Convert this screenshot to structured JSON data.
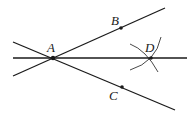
{
  "diagram": {
    "type": "geometry-construction",
    "stroke_color": "#1a1a1a",
    "background": "#ffffff",
    "points": [
      {
        "id": "A",
        "label": "A",
        "x": 53,
        "y": 58,
        "label_x": 47,
        "label_y": 52
      },
      {
        "id": "B",
        "label": "B",
        "x": 121,
        "y": 28,
        "label_x": 111,
        "label_y": 25
      },
      {
        "id": "C",
        "label": "C",
        "x": 122,
        "y": 87,
        "label_x": 109,
        "label_y": 100
      },
      {
        "id": "D",
        "label": "D",
        "x": 151,
        "y": 58,
        "label_x": 145,
        "label_y": 52
      }
    ],
    "lines": [
      {
        "id": "ray-ab",
        "x1": 13,
        "y1": 76,
        "x2": 165,
        "y2": 8
      },
      {
        "id": "ray-ac",
        "x1": 13,
        "y1": 42,
        "x2": 175,
        "y2": 110
      },
      {
        "id": "bisector-ad",
        "x1": 13,
        "y1": 58,
        "x2": 187,
        "y2": 58
      }
    ],
    "arcs": [
      {
        "id": "arc-from-b",
        "d": "M 130 44 Q 146 50 158 72"
      },
      {
        "id": "arc-from-c",
        "d": "M 161 37 Q 156 62 130 70"
      }
    ]
  }
}
